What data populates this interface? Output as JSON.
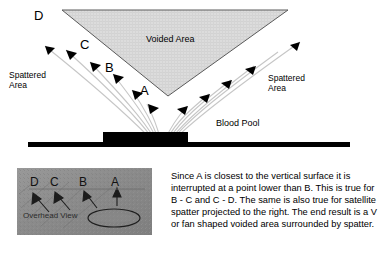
{
  "diagram": {
    "voided_area_label": "Voided Area",
    "spattered_area_left_label": "Spattered\nArea",
    "spattered_area_right_label": "Spattered\nArea",
    "blood_pool_label": "Blood Pool",
    "trajectory_labels": {
      "a": "A",
      "b": "B",
      "c": "C",
      "d": "D"
    },
    "colors": {
      "voided_fill": "#d9d9d9",
      "voided_outline": "#555555",
      "blood_pool": "#000000",
      "baseline": "#000000",
      "trajectory_line": "#bdbdbd",
      "arrowhead": "#000000",
      "background": "#ffffff"
    }
  },
  "overhead_view": {
    "caption": "Overhead View",
    "labels": {
      "a": "A",
      "b": "B",
      "c": "C",
      "d": "D"
    },
    "colors": {
      "photo_background": "#8f8f8f",
      "marks": "#1a1a1a"
    }
  },
  "explanation": {
    "text": "Since A is closest to the vertical surface it is interrupted at a point  lower than B.  This is true for B - C and C - D.   The same is also true for satellite spatter projected to the right.   The end result is a V  or fan shaped voided area surrounded by spatter."
  }
}
